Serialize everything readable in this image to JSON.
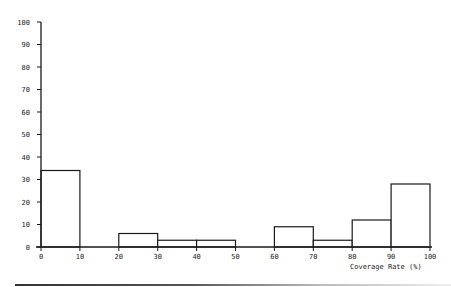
{
  "chart_data": {
    "type": "bar",
    "subtype": "histogram",
    "title": "",
    "xlabel": "Coverage Rate (%)",
    "ylabel": "",
    "xlim": [
      0,
      100
    ],
    "ylim": [
      0,
      100
    ],
    "x_ticks": [
      0,
      10,
      20,
      30,
      40,
      50,
      60,
      70,
      80,
      90,
      100
    ],
    "y_ticks": [
      0,
      10,
      20,
      30,
      40,
      50,
      60,
      70,
      80,
      90,
      100
    ],
    "grid": false,
    "legend": null,
    "categories": [
      "0-10",
      "10-20",
      "20-30",
      "30-40",
      "40-50",
      "50-60",
      "60-70",
      "70-80",
      "80-90",
      "90-100"
    ],
    "bins": [
      [
        0,
        10
      ],
      [
        10,
        20
      ],
      [
        20,
        30
      ],
      [
        30,
        40
      ],
      [
        40,
        50
      ],
      [
        50,
        60
      ],
      [
        60,
        70
      ],
      [
        70,
        80
      ],
      [
        80,
        90
      ],
      [
        90,
        100
      ]
    ],
    "values": [
      34,
      0,
      6,
      3,
      3,
      0,
      9,
      3,
      12,
      28
    ]
  },
  "labels": {
    "xlabel": "Coverage Rate (%)"
  }
}
